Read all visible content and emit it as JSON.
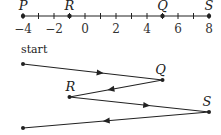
{
  "number_line": {
    "min": -4,
    "max": 8,
    "tick_step": 1,
    "tick_labels": [
      "-4",
      "-2",
      "0",
      "2",
      "4",
      "6",
      "8"
    ],
    "tick_label_values": [
      -4,
      -2,
      0,
      2,
      4,
      6,
      8
    ],
    "points": [
      {
        "name": "P",
        "value": -4
      },
      {
        "name": "R",
        "value": -1
      },
      {
        "name": "Q",
        "value": 5
      },
      {
        "name": "S",
        "value": 8
      }
    ]
  },
  "path": {
    "start_label": "start",
    "sequence": [
      {
        "label": "",
        "value": -4
      },
      {
        "label": "Q",
        "value": 5
      },
      {
        "label": "R",
        "value": -1
      },
      {
        "label": "S",
        "value": 8
      },
      {
        "label": "",
        "value": -4
      }
    ]
  },
  "colors": {
    "ink": "#222222"
  }
}
